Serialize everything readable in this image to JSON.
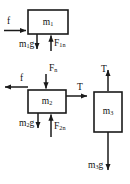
{
  "diagram": {
    "stroke_color": "#1a1a1a",
    "background_color": "#ffffff",
    "blocks": [
      {
        "id": "block-1",
        "label_base": "m",
        "label_sub": "1",
        "x": 28,
        "y": 10,
        "w": 40,
        "h": 24
      },
      {
        "id": "block-2",
        "label_base": "m",
        "label_sub": "2",
        "x": 28,
        "y": 90,
        "w": 38,
        "h": 23
      },
      {
        "id": "block-3",
        "label_base": "m",
        "label_sub": "3",
        "x": 94,
        "y": 92,
        "w": 28,
        "h": 40
      }
    ],
    "forces": [
      {
        "id": "friction-on-m1",
        "block": "block-1",
        "label_base": "f",
        "label_sub": "",
        "direction": "right"
      },
      {
        "id": "weight-m1",
        "block": "block-1",
        "label_base": "m",
        "label_sub": "1",
        "label_tail": "g",
        "direction": "down"
      },
      {
        "id": "normal-on-m1",
        "block": "block-1",
        "label_base": "F",
        "label_sub": "1",
        "label_tail": "n",
        "direction": "up"
      },
      {
        "id": "friction-on-m2",
        "block": "block-2",
        "label_base": "f",
        "label_sub": "",
        "direction": "left"
      },
      {
        "id": "normal-from-m1-on-m2",
        "block": "block-2",
        "label_base": "F",
        "label_sub": "",
        "label_tail": "n",
        "direction": "down"
      },
      {
        "id": "tension-on-m2",
        "block": "block-2",
        "label_base": "T",
        "label_sub": "",
        "direction": "right"
      },
      {
        "id": "weight-m2",
        "block": "block-2",
        "label_base": "m",
        "label_sub": "2",
        "label_tail": "g",
        "direction": "down"
      },
      {
        "id": "normal-on-m2",
        "block": "block-2",
        "label_base": "F",
        "label_sub": "2",
        "label_tail": "n",
        "direction": "up"
      },
      {
        "id": "tension-on-m3",
        "block": "block-3",
        "label_base": "T",
        "label_sub": "",
        "direction": "up"
      },
      {
        "id": "weight-m3",
        "block": "block-3",
        "label_base": "m",
        "label_sub": "3",
        "label_tail": "g",
        "direction": "down"
      }
    ],
    "labels": {
      "m1": "m",
      "m1_sub": "1",
      "m2": "m",
      "m2_sub": "2",
      "m3": "m",
      "m3_sub": "3",
      "f1": "f",
      "f2": "f",
      "T_m2": "T",
      "T_m3": "T",
      "Fn_m2_top": "F",
      "Fn_m2_top_sub": "n",
      "F1n": "F",
      "F1n_sub": "1",
      "F1n_tail": "n",
      "F2n": "F",
      "F2n_sub": "2",
      "F2n_tail": "n",
      "m1g": "m",
      "m1g_sub": "1",
      "m1g_tail": "g",
      "m2g": "m",
      "m2g_sub": "2",
      "m2g_tail": "g",
      "m3g": "m",
      "m3g_sub": "3",
      "m3g_tail": "g"
    }
  }
}
